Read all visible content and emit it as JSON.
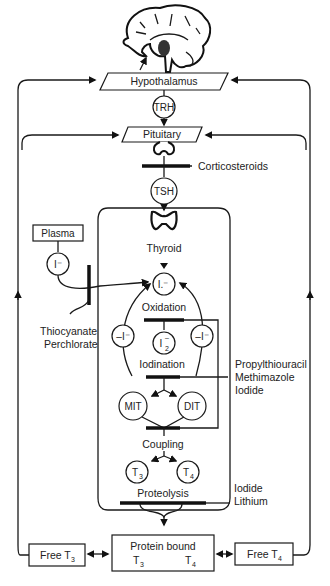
{
  "diagram": {
    "nodes": {
      "hypothalamus": "Hypothalamus",
      "trh": "TRH",
      "pituitary": "Pituitary",
      "tsh": "TSH",
      "thyroid": "Thyroid",
      "plasma": "Plasma",
      "plasma_iodide": "I⁻",
      "thyroid_iodide": "I.⁻",
      "oxidation": "Oxidation",
      "left_minus": "–I⁻",
      "right_minus": "–I⁻",
      "i2_base": "I",
      "i2_sub": "2",
      "i2_sup": "–",
      "iodination": "Iodination",
      "mit": "MIT",
      "dit": "DIT",
      "coupling": "Coupling",
      "t3_base": "T",
      "t3_sub": "3",
      "t4_base": "T",
      "t4_sub": "4",
      "proteolysis": "Proteolysis",
      "protein_bound": "Protein bound",
      "pb_t3_base": "T",
      "pb_t3_sub": "3",
      "pb_t4_base": "T",
      "pb_t4_sub": "4",
      "free_t3_base": "Free T",
      "free_t3_sub": "3",
      "free_t4_base": "Free T",
      "free_t4_sub": "4"
    },
    "inhibitors": {
      "corticosteroids": "Corticosteroids",
      "thiocyanate": "Thiocyanate",
      "perchlorate": "Perchlorate",
      "propylthiouracil": "Propylthiouracil",
      "methimazole": "Methimazole",
      "iodide_1": "Iodide",
      "iodide_2": "Iodide",
      "lithium": "Lithium"
    }
  }
}
